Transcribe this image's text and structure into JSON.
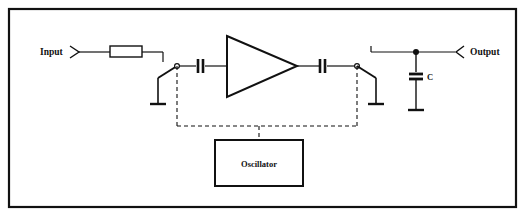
{
  "figure": {
    "type": "schematic-diagram",
    "title_visible": false,
    "background_color": "#ffffff",
    "line_color": "#111111",
    "frame": {
      "name": "outer-border",
      "x": 8,
      "y": 8,
      "width": 509,
      "height": 200,
      "stroke_width": 2.2
    }
  },
  "labels": {
    "input": "Input",
    "output": "Output",
    "capacitor_c": "C",
    "oscillator": "Oscillator"
  },
  "components": {
    "input_terminal": {
      "label": "Input",
      "x": 75,
      "y": 52
    },
    "resistor": {
      "x": 110,
      "y": 46,
      "width": 32,
      "height": 11
    },
    "switch_left": {
      "pivot_x": 177,
      "pivot_y": 66,
      "ground_x": 158,
      "ground_y": 104
    },
    "switch_right": {
      "pivot_x": 357,
      "pivot_y": 66,
      "ground_x": 376,
      "ground_y": 104
    },
    "capacitor_in": {
      "x": 200,
      "y": 66
    },
    "capacitor_out": {
      "x": 322,
      "y": 66
    },
    "amplifier": {
      "tip_x": 297,
      "tip_y": 66,
      "back_x": 227,
      "top_y": 36,
      "bottom_y": 97
    },
    "capacitor_shunt": {
      "label": "C",
      "x": 416,
      "y": 78,
      "ground_y": 110
    },
    "output_terminal": {
      "label": "Output",
      "x": 460,
      "y": 52
    },
    "junction_dot": {
      "x": 416,
      "y": 52
    },
    "oscillator_box": {
      "label": "Oscillator",
      "x": 215,
      "y": 140,
      "width": 88,
      "height": 46
    },
    "control_bus": {
      "y": 126,
      "left_x": 177,
      "right_x": 357,
      "drop_x": 259
    }
  }
}
